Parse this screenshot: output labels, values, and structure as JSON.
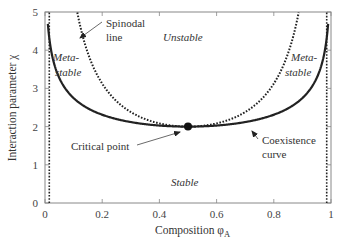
{
  "chart_data": {
    "type": "line",
    "title": "",
    "xlabel": "Composition φA",
    "xlabel_main": "Composition φ",
    "xlabel_sub": "A",
    "ylabel": "Interaction parameter χ",
    "xlim": [
      0,
      1
    ],
    "ylim": [
      0,
      5
    ],
    "xticks": [
      0,
      0.2,
      0.4,
      0.6,
      0.8,
      1
    ],
    "xtick_labels": [
      "0",
      "0.2",
      "0.4",
      "0.6",
      "0.8",
      "1"
    ],
    "yticks": [
      0,
      1,
      2,
      3,
      4,
      5
    ],
    "ytick_labels": [
      "0",
      "1",
      "2",
      "3",
      "4",
      "5"
    ],
    "grid": false,
    "legend": null,
    "series": [
      {
        "name": "Coexistence curve",
        "style": "solid",
        "formula": "chi = ln(phi/(1-phi)) / (2*phi - 1)",
        "x": [
          0.01,
          0.02,
          0.05,
          0.1,
          0.15,
          0.2,
          0.25,
          0.3,
          0.35,
          0.4,
          0.45,
          0.5,
          0.55,
          0.6,
          0.65,
          0.7,
          0.75,
          0.8,
          0.85,
          0.9,
          0.95,
          0.98,
          0.99
        ],
        "y": [
          4.64,
          4.05,
          3.27,
          2.75,
          2.53,
          2.31,
          2.2,
          2.12,
          2.07,
          2.03,
          2.01,
          2.0,
          2.01,
          2.03,
          2.07,
          2.12,
          2.2,
          2.31,
          2.53,
          2.75,
          3.27,
          4.05,
          4.64
        ]
      },
      {
        "name": "Spinodal line",
        "style": "dotted",
        "formula": "chi = 1 / (2*phi*(1-phi))",
        "x": [
          0.113,
          0.15,
          0.2,
          0.25,
          0.3,
          0.35,
          0.4,
          0.45,
          0.5,
          0.55,
          0.6,
          0.65,
          0.7,
          0.75,
          0.8,
          0.85,
          0.887
        ],
        "y": [
          5.0,
          3.92,
          3.13,
          2.67,
          2.38,
          2.2,
          2.08,
          2.02,
          2.0,
          2.02,
          2.08,
          2.2,
          2.38,
          2.67,
          3.13,
          3.92,
          5.0
        ]
      },
      {
        "name": "Left vertical dotted bound",
        "style": "dotted",
        "x": [
          0.015,
          0.015
        ],
        "y": [
          0,
          5
        ]
      },
      {
        "name": "Right vertical dotted bound",
        "style": "dotted",
        "x": [
          0.985,
          0.985
        ],
        "y": [
          0,
          5
        ]
      }
    ],
    "critical_point": {
      "x": 0.5,
      "y": 2.0,
      "label": "Critical point"
    },
    "annotations": [
      {
        "text": "Spinodal line",
        "lines": [
          "Spinodal",
          "line"
        ],
        "arrow_to": [
          0.115,
          4.75
        ]
      },
      {
        "text": "Critical point",
        "arrow_to": [
          0.49,
          1.97
        ]
      },
      {
        "text": "Coexistence curve",
        "lines": [
          "Coexistence",
          "curve"
        ],
        "arrow_to": [
          0.66,
          2.1
        ]
      },
      {
        "text": "Unstable",
        "region": true,
        "italic": true
      },
      {
        "text": "Meta-stable",
        "lines": [
          "Meta-",
          "stable"
        ],
        "region": true,
        "italic": true,
        "side": "left"
      },
      {
        "text": "Meta-stable",
        "lines": [
          "Meta-",
          "stable"
        ],
        "region": true,
        "italic": true,
        "side": "right"
      },
      {
        "text": "Stable",
        "region": true,
        "italic": true
      }
    ]
  },
  "labels": {
    "spinodal_1": "Spinodal",
    "spinodal_2": "line",
    "unstable": "Unstable",
    "meta_left_1": "Meta-",
    "meta_left_2": "stable",
    "meta_right_1": "Meta-",
    "meta_right_2": "stable",
    "critical": "Critical point",
    "coex_1": "Coexistence",
    "coex_2": "curve",
    "stable": "Stable",
    "xlabel_main": "Composition φ",
    "xlabel_sub": "A",
    "ylabel": "Interaction parameter χ"
  },
  "colors": {
    "axis": "#777777",
    "curve": "#222222",
    "text": "#333333"
  }
}
